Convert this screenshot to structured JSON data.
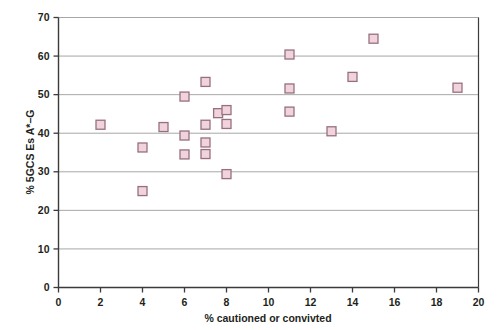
{
  "chart_data": {
    "type": "scatter",
    "title": "",
    "subtitle": "",
    "xlabel": "% cautioned or convivted",
    "ylabel": "% 5GCS Es A*–G",
    "xlim": [
      0,
      20
    ],
    "ylim": [
      0,
      70
    ],
    "xticks": [
      0,
      2,
      4,
      6,
      8,
      10,
      12,
      14,
      16,
      18,
      20
    ],
    "yticks": [
      0,
      10,
      20,
      30,
      40,
      50,
      60,
      70
    ],
    "xtick_labels": [
      "0",
      "2",
      "4",
      "6",
      "8",
      "10",
      "12",
      "14",
      "16",
      "18",
      "20"
    ],
    "ytick_labels": [
      "0",
      "10",
      "20",
      "30",
      "40",
      "50",
      "60",
      "70"
    ],
    "grid": "horizontal",
    "legend": "none",
    "legend_position": "",
    "annotations": [],
    "marker": {
      "shape": "square",
      "size": 9,
      "fill": "#f1d3dd",
      "edge": "#97707f"
    },
    "series": [
      {
        "name": "schools",
        "points": [
          [
            2.0,
            42.2
          ],
          [
            4.0,
            36.3
          ],
          [
            4.0,
            25.0
          ],
          [
            5.0,
            41.6
          ],
          [
            6.0,
            49.5
          ],
          [
            6.0,
            39.4
          ],
          [
            6.0,
            34.5
          ],
          [
            7.0,
            53.3
          ],
          [
            7.0,
            42.2
          ],
          [
            7.0,
            37.6
          ],
          [
            7.0,
            34.6
          ],
          [
            7.6,
            45.2
          ],
          [
            8.0,
            46.0
          ],
          [
            8.0,
            42.4
          ],
          [
            8.0,
            29.4
          ],
          [
            11.0,
            60.4
          ],
          [
            11.0,
            51.6
          ],
          [
            11.0,
            45.6
          ],
          [
            13.0,
            40.5
          ],
          [
            14.0,
            54.6
          ],
          [
            15.0,
            64.5
          ],
          [
            19.0,
            51.8
          ]
        ]
      }
    ]
  },
  "axes": {
    "x_title": "% cautioned or convivted",
    "y_title": "% 5GCS Es A*–G"
  },
  "colors": {
    "marker_fill": "#f1d3dd",
    "marker_edge": "#97707f",
    "axis": "#3b3b3b",
    "grid": "#9d9d9d",
    "text": "#231f20",
    "background": "#ffffff"
  }
}
